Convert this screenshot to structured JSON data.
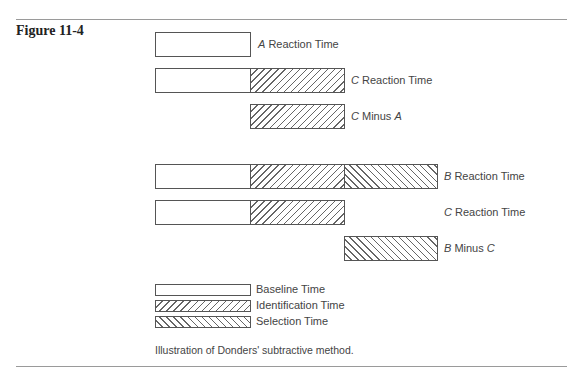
{
  "figure": {
    "number": "Figure 11-4",
    "caption": "Illustration of Donders' subtractive method."
  },
  "colors": {
    "rule": "#9a9a9a",
    "stroke": "#555555",
    "text": "#444444"
  },
  "rows": [
    {
      "id": "a-reaction",
      "var": "A",
      "label": " Reaction Time"
    },
    {
      "id": "c-reaction",
      "var": "C",
      "label": " Reaction Time"
    },
    {
      "id": "c-minus-a",
      "var": "C",
      "label": " Minus ",
      "var2": "A"
    },
    {
      "id": "b-reaction",
      "var": "B",
      "label": " Reaction Time"
    },
    {
      "id": "c-reaction-2",
      "var": "C",
      "label": " Reaction Time"
    },
    {
      "id": "b-minus-c",
      "var": "B",
      "label": " Minus ",
      "var2": "C"
    }
  ],
  "legend": [
    {
      "pattern": "blank",
      "label": "Baseline Time"
    },
    {
      "pattern": "forward-hatch",
      "label": "Identification Time"
    },
    {
      "pattern": "back-hatch",
      "label": "Selection Time"
    }
  ]
}
